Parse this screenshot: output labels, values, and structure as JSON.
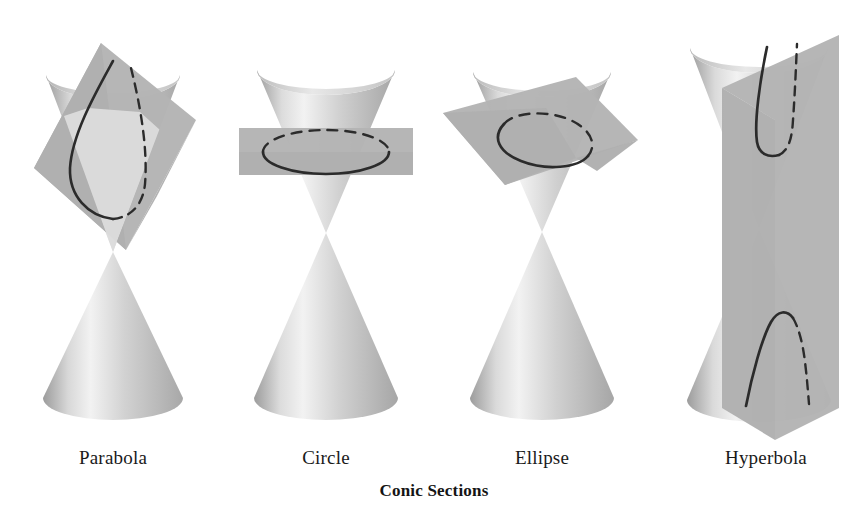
{
  "figure": {
    "caption": "Conic Sections",
    "background_color": "#ffffff",
    "curve_color": "#2b2b2b",
    "plane_color": "#b4b4b4",
    "cone_light": "#f0f0f0",
    "cone_mid": "#c9c9c9",
    "cone_dark": "#9a9a9a"
  },
  "panels": [
    {
      "id": "parabola",
      "label": "Parabola",
      "cut_plane": "tilted-plane-parallel-to-slant",
      "curve_name": "parabola-curve",
      "curve_shape": "open-u",
      "cone_type": "double-nappe",
      "label_center_x": 113
    },
    {
      "id": "circle",
      "label": "Circle",
      "cut_plane": "horizontal-plane",
      "curve_name": "circle-curve",
      "curve_shape": "closed-ellipse-in-perspective",
      "cone_type": "double-nappe",
      "label_center_x": 326
    },
    {
      "id": "ellipse",
      "label": "Ellipse",
      "cut_plane": "oblique-plane",
      "curve_name": "ellipse-curve",
      "curve_shape": "closed-slanted-ellipse",
      "cone_type": "double-nappe",
      "label_center_x": 542
    },
    {
      "id": "hyperbola",
      "label": "Hyperbola",
      "cut_plane": "vertical-plane",
      "curve_name": "hyperbola-curve",
      "curve_shape": "two-open-branches",
      "cone_type": "double-nappe",
      "label_center_x": 766
    }
  ]
}
